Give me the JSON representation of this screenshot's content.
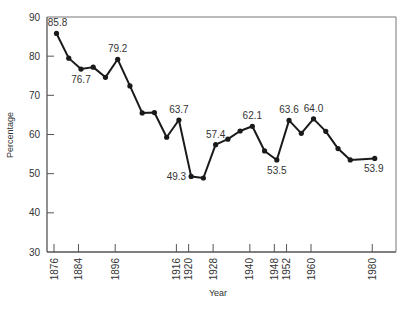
{
  "chart_data": {
    "type": "line",
    "title": "",
    "xlabel": "Year",
    "ylabel": "Percentage",
    "ylim": [
      30,
      90
    ],
    "yticks": [
      30,
      40,
      50,
      60,
      70,
      80,
      90
    ],
    "xticks": [
      1876,
      1884,
      1896,
      1916,
      1920,
      1928,
      1940,
      1948,
      1952,
      1960,
      1980
    ],
    "grid": false,
    "legend": null,
    "series": [
      {
        "name": "Percentage",
        "x": [
          1876,
          1880,
          1884,
          1888,
          1892,
          1896,
          1900,
          1904,
          1908,
          1912,
          1916,
          1920,
          1924,
          1928,
          1932,
          1936,
          1940,
          1944,
          1948,
          1952,
          1956,
          1960,
          1964,
          1968,
          1972,
          1980
        ],
        "values": [
          85.8,
          79.5,
          76.7,
          77.2,
          74.6,
          79.2,
          72.4,
          65.5,
          65.6,
          59.3,
          63.7,
          49.3,
          48.9,
          57.4,
          58.8,
          60.9,
          62.1,
          55.8,
          53.5,
          63.6,
          60.3,
          64.0,
          60.8,
          56.4,
          53.5,
          53.9
        ]
      }
    ],
    "annotations": [
      {
        "x": 1876,
        "y": 85.8,
        "text": "85.8",
        "pos": "above"
      },
      {
        "x": 1884,
        "y": 76.7,
        "text": "76.7",
        "pos": "below"
      },
      {
        "x": 1896,
        "y": 79.2,
        "text": "79.2",
        "pos": "above"
      },
      {
        "x": 1916,
        "y": 63.7,
        "text": "63.7",
        "pos": "above"
      },
      {
        "x": 1920,
        "y": 49.3,
        "text": "49.3",
        "pos": "left"
      },
      {
        "x": 1928,
        "y": 57.4,
        "text": "57.4",
        "pos": "above"
      },
      {
        "x": 1940,
        "y": 62.1,
        "text": "62.1",
        "pos": "above"
      },
      {
        "x": 1948,
        "y": 53.5,
        "text": "53.5",
        "pos": "below"
      },
      {
        "x": 1952,
        "y": 63.6,
        "text": "63.6",
        "pos": "above"
      },
      {
        "x": 1960,
        "y": 64.0,
        "text": "64.0",
        "pos": "above"
      },
      {
        "x": 1980,
        "y": 53.9,
        "text": "53.9",
        "pos": "below"
      }
    ]
  },
  "colors": {
    "line": "#1a1a1a",
    "axis": "#555555",
    "text": "#333333"
  }
}
